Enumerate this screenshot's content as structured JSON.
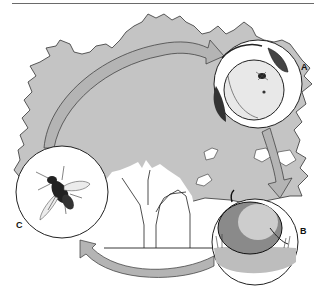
{
  "diagram": {
    "type": "life-cycle",
    "stages": [
      {
        "id": "A",
        "label": "A",
        "description": "adult fly on fruit hanging on branch"
      },
      {
        "id": "B",
        "label": "B",
        "description": "fallen fruit on the ground"
      },
      {
        "id": "C",
        "label": "C",
        "description": "adult fly"
      }
    ],
    "arrows": [
      {
        "from": "C",
        "to": "A"
      },
      {
        "from": "A",
        "to": "B"
      },
      {
        "from": "B",
        "to": "C"
      }
    ],
    "colors": {
      "canopy": "#c4c4c4",
      "arrow_fill": "#b4b4b4",
      "outline": "#222222",
      "background": "#ffffff"
    }
  }
}
